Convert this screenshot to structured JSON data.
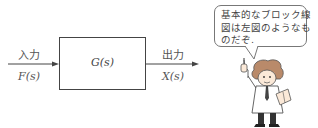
{
  "block_diagram": {
    "input_label": "入力",
    "input_signal": "F(s)",
    "transfer_function": "G(s)",
    "output_label": "出力",
    "output_signal": "X(s)"
  },
  "speech_bubble": {
    "lines": [
      "基本的なブロック線",
      "図は左図のようなも",
      "のだぞ."
    ]
  },
  "character": {
    "description": "professor-cartoon"
  },
  "colors": {
    "line": "#444444",
    "text": "#555555",
    "background": "#ffffff"
  }
}
